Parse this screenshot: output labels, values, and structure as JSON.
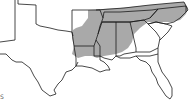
{
  "map": {
    "title": "",
    "region": "Southeastern United States",
    "colors": {
      "background": "#ffffff",
      "range_fill": "#a9a9a9",
      "border": "#1a1a1a",
      "land": "#ffffff"
    },
    "shaded_states": [
      "Arkansas (east)",
      "Louisiana",
      "Mississippi",
      "Alabama",
      "Tennessee",
      "Kentucky",
      "Georgia (north/west)",
      "South Carolina (northwest)",
      "North Carolina (west)",
      "Virginia (southwest)"
    ],
    "unshaded_states": [
      "Oklahoma",
      "Texas",
      "Florida",
      "South Carolina (coast)",
      "North Carolina (coast)"
    ]
  },
  "caption": {
    "fragment": "S"
  }
}
